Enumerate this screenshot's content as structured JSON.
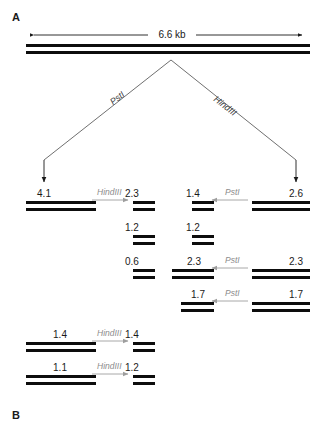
{
  "figure": {
    "panels": [
      {
        "id": "panel-a",
        "label": "A"
      },
      {
        "id": "panel-b",
        "label": "B"
      }
    ],
    "scale_bar": {
      "label": "6.6 kb"
    },
    "parent_molecule": {
      "size_label": "6.6 kb"
    },
    "branch_enzymes": [
      {
        "id": "branch-left",
        "label": "PstI"
      },
      {
        "id": "branch-right",
        "label": "HindIII"
      }
    ],
    "digests": [
      {
        "id": "digest-psti-4100",
        "input_label": "4.1",
        "enzyme": "HindIII",
        "products": [
          "2.3",
          "1.2",
          "0.6"
        ]
      },
      {
        "id": "digest-hindiii-2600",
        "input_label": "2.6",
        "enzyme": "PstI",
        "products": [
          "1.4",
          "1.2"
        ]
      },
      {
        "id": "digest-hindiii-2300",
        "input_label": "2.3",
        "enzyme": "PstI",
        "products": [
          "2.3"
        ]
      },
      {
        "id": "digest-hindiii-1700",
        "input_label": "1.7",
        "enzyme": "PstI",
        "products": [
          "1.7"
        ]
      },
      {
        "id": "digest-psti-1400",
        "input_label": "1.4",
        "enzyme": "HindIII",
        "products": [
          "1.4"
        ]
      },
      {
        "id": "digest-psti-1100",
        "input_label": "1.1",
        "enzyme": "HindIII",
        "products": [
          "1.2"
        ]
      }
    ],
    "colors": {
      "band": "#0d0d0d",
      "enzyme_text": "#8c8c8c",
      "arrow_gray": "#9e9e9e",
      "arrow_black": "#1a1a1a",
      "background": "#ffffff"
    }
  }
}
